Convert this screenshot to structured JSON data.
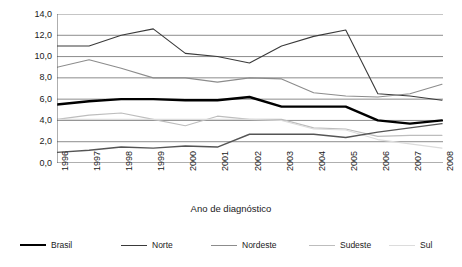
{
  "chart_data": {
    "type": "line",
    "title": "",
    "xlabel": "Ano de diagnóstico",
    "ylabel": "Taxa de incidência",
    "x": [
      1996,
      1997,
      1998,
      1999,
      2000,
      2001,
      2002,
      2003,
      2004,
      2005,
      2006,
      2007,
      2008
    ],
    "xtick_labels": [
      "1996",
      "1997",
      "1998",
      "1999",
      "2000",
      "2001",
      "2002",
      "2003",
      "2004",
      "2005",
      "2006",
      "2007",
      "2008"
    ],
    "ytick_labels": [
      "0,0",
      "2,0",
      "4,0",
      "6,0",
      "8,0",
      "10,0",
      "12,0",
      "14,0"
    ],
    "ytick_values": [
      0,
      2,
      4,
      6,
      8,
      10,
      12,
      14
    ],
    "ylim": [
      0,
      14
    ],
    "grid": "horizontal",
    "legend_position": "bottom",
    "series": [
      {
        "name": "Brasil",
        "color": "#000000",
        "width": 2.4,
        "values": [
          5.5,
          5.8,
          6.0,
          6.0,
          5.9,
          5.9,
          6.2,
          5.3,
          5.3,
          5.3,
          4.0,
          3.7,
          4.0
        ]
      },
      {
        "name": "Norte",
        "color": "#3a3a3a",
        "width": 1.1,
        "values": [
          11.0,
          11.0,
          12.0,
          12.6,
          10.3,
          10.0,
          9.4,
          11.0,
          11.9,
          12.5,
          6.5,
          6.3,
          5.9
        ]
      },
      {
        "name": "Nordeste",
        "color": "#8c8c8c",
        "width": 1.1,
        "values": [
          9.0,
          9.7,
          8.9,
          8.0,
          8.0,
          7.6,
          8.0,
          7.9,
          6.6,
          6.3,
          6.2,
          6.5,
          7.4
        ]
      },
      {
        "name": "Sudeste",
        "color": "#bdbdbd",
        "width": 1.1,
        "values": [
          4.1,
          4.5,
          4.7,
          4.1,
          3.5,
          4.4,
          4.1,
          4.1,
          3.3,
          3.2,
          2.5,
          2.6,
          2.6
        ]
      },
      {
        "name": "Sul",
        "color": "#dcdcdc",
        "width": 1.1,
        "values": [
          4.1,
          4.1,
          4.1,
          4.1,
          4.1,
          4.1,
          4.1,
          4.0,
          3.2,
          3.1,
          2.2,
          1.8,
          1.4
        ]
      },
      {
        "name": "Centro-Oeste",
        "color": "#555555",
        "width": 1.4,
        "values": [
          1.0,
          1.2,
          1.5,
          1.4,
          1.6,
          1.5,
          2.7,
          2.7,
          2.7,
          2.4,
          2.9,
          3.3,
          3.7
        ]
      }
    ]
  },
  "axes": {
    "ylabel": "Taxa de incidência",
    "xlabel": "Ano de diagnóstico"
  },
  "legend": {
    "items": [
      {
        "label": "Brasil"
      },
      {
        "label": "Norte"
      },
      {
        "label": "Nordeste"
      },
      {
        "label": "Sudeste"
      },
      {
        "label": "Sul"
      },
      {
        "label": "Centro-Oeste"
      }
    ]
  }
}
